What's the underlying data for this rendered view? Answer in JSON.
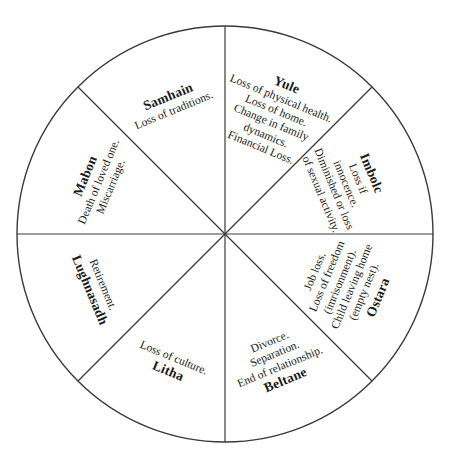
{
  "figure": {
    "type": "wheel-of-the-year-grief-diagram",
    "shape": "circle divided into eight equal wedges",
    "geometry": {
      "center_x": 225,
      "center_y": 234,
      "radius": 208,
      "wedge_count": 8
    },
    "style": {
      "background_color": "#ffffff",
      "stroke_color": "#3a3a3a",
      "text_color": "#1a1a1a"
    }
  },
  "wedges": [
    {
      "id": "yule",
      "name": "Yule",
      "position": "top-right-upper",
      "rotation_deg": 22.5,
      "radial_offset": 128,
      "lines": [
        "Loss of physical health.",
        "Loss of home.",
        "Change in family",
        "dynamics.",
        "Financial Loss."
      ]
    },
    {
      "id": "imbolc",
      "name": "Imbolc",
      "position": "upper-right",
      "rotation_deg": 67.5,
      "radial_offset": 132,
      "lines": [
        "Loss if",
        "innocence.",
        "Diminished or loss",
        "of sexual activity."
      ]
    },
    {
      "id": "ostara",
      "name": "Ostara",
      "position": "lower-right",
      "rotation_deg": 112.5,
      "radial_offset": 132,
      "lines": [
        "Job loss.",
        "Loss of freedom",
        "(imrisonment).",
        "Child leaving home",
        "(empty nest)."
      ]
    },
    {
      "id": "beltane",
      "name": "Beltane",
      "position": "bottom-right-lower",
      "rotation_deg": 157.5,
      "radial_offset": 138,
      "lines": [
        "Divorce.",
        "Separation.",
        "End of relationship."
      ]
    },
    {
      "id": "litha",
      "name": "Litha",
      "position": "bottom-left-lower",
      "rotation_deg": 202.5,
      "radial_offset": 142,
      "lines": [
        "Loss of culture."
      ]
    },
    {
      "id": "lughnasadh",
      "name": "Lughnasadh",
      "position": "lower-left",
      "rotation_deg": 247.5,
      "radial_offset": 140,
      "lines": [
        "Retirement."
      ]
    },
    {
      "id": "mabon",
      "name": "Mabon",
      "position": "upper-left",
      "rotation_deg": 292.5,
      "radial_offset": 138,
      "lines": [
        "Death of loved one.",
        "Miscarriage."
      ]
    },
    {
      "id": "samhain",
      "name": "Samhain",
      "position": "top-left-upper",
      "rotation_deg": 337.5,
      "radial_offset": 142,
      "lines": [
        "Loss of traditions."
      ]
    }
  ]
}
